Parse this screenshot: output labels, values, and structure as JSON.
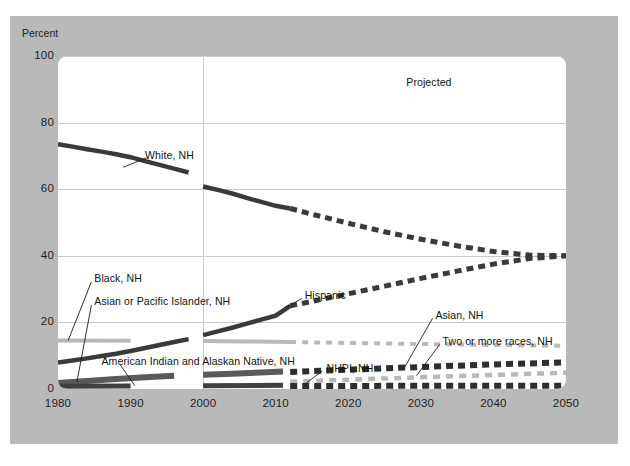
{
  "figure": {
    "percent_axis_title": "Percent",
    "projected_note": "Projected"
  },
  "chart_data": {
    "type": "line",
    "title": "",
    "subtitle": "",
    "xlabel": "",
    "ylabel": "Percent",
    "xlim": [
      1980,
      2050
    ],
    "ylim": [
      0,
      100
    ],
    "grid": true,
    "legend_position": "inline-annotations",
    "xticks": [
      "1980",
      "1990",
      "2000",
      "2010",
      "2020",
      "2030",
      "2040",
      "2050"
    ],
    "yticks": [
      "0",
      "20",
      "40",
      "60",
      "80",
      "100"
    ],
    "annotations": [
      {
        "text": "Projected",
        "x": 2028,
        "y": 92
      },
      {
        "text": "White, NH",
        "x": 1992,
        "y": 70
      },
      {
        "text": "Black, NH",
        "x": 1985,
        "y": 33
      },
      {
        "text": "Asian or Pacific Islander, NH",
        "x": 1985,
        "y": 26
      },
      {
        "text": "American Indian and Alaskan Native, NH",
        "x": 1986,
        "y": 8
      },
      {
        "text": "Hispanic",
        "x": 2014,
        "y": 28
      },
      {
        "text": "Asian, NH",
        "x": 2032,
        "y": 22
      },
      {
        "text": "Two or more races, NH",
        "x": 2033,
        "y": 14
      },
      {
        "text": "NHPI, NH",
        "x": 2017,
        "y": 6
      }
    ],
    "projection_start_year": 2012,
    "vertical_gridline_years": [
      2000
    ],
    "series": [
      {
        "name": "White, NH",
        "style": "solid-then-dashed",
        "color": "#3a3a3a",
        "x": [
          1980,
          1982,
          1984,
          1986,
          1988,
          1990,
          1992,
          1994,
          1996,
          1998,
          2000,
          2002,
          2004,
          2006,
          2008,
          2010,
          2012,
          2015,
          2020,
          2025,
          2030,
          2035,
          2040,
          2045,
          2050
        ],
        "values": [
          73.5,
          72.8,
          72.0,
          71.3,
          70.5,
          69.6,
          68.4,
          67.3,
          66.2,
          65.0,
          60.8,
          59.8,
          58.7,
          57.4,
          56.2,
          55.0,
          54.2,
          52.5,
          49.8,
          47.2,
          45.0,
          43.0,
          41.3,
          40.2,
          40.0
        ]
      },
      {
        "name": "Hispanic",
        "style": "solid-then-dashed",
        "color": "#3a3a3a",
        "x": [
          1980,
          1982,
          1984,
          1986,
          1988,
          1990,
          1992,
          1994,
          1996,
          1998,
          2000,
          2002,
          2004,
          2006,
          2008,
          2010,
          2012,
          2015,
          2020,
          2025,
          2030,
          2035,
          2040,
          2045,
          2050
        ],
        "values": [
          8.0,
          8.6,
          9.2,
          9.9,
          10.6,
          11.4,
          12.3,
          13.2,
          14.1,
          15.0,
          16.2,
          17.3,
          18.4,
          19.6,
          20.8,
          22.0,
          25.0,
          26.3,
          28.6,
          30.9,
          33.2,
          35.4,
          37.5,
          39.2,
          40.0
        ]
      },
      {
        "name": "Black, NH",
        "style": "light-solid-then-dashed",
        "color": "#b8b8b8",
        "x": [
          1980,
          1990,
          2000,
          2005,
          2010,
          2012,
          2020,
          2030,
          2040,
          2050
        ],
        "values": [
          14.6,
          14.5,
          14.4,
          14.3,
          14.2,
          14.1,
          13.8,
          13.5,
          13.2,
          13.0
        ]
      },
      {
        "name": "Asian or Pacific Islander, NH",
        "style": "dark-solid",
        "color": "#5a5a5a",
        "x": [
          1980,
          1984,
          1988,
          1992,
          1996,
          2000,
          2004,
          2008,
          2011
        ],
        "values": [
          1.8,
          2.4,
          3.0,
          3.5,
          4.0,
          4.3,
          4.6,
          5.0,
          5.3
        ]
      },
      {
        "name": "Asian, NH",
        "style": "dashed",
        "color": "#2e2e2e",
        "x": [
          2012,
          2020,
          2030,
          2040,
          2050
        ],
        "values": [
          5.1,
          5.8,
          6.6,
          7.4,
          8.0
        ]
      },
      {
        "name": "Two or more races, NH",
        "style": "light-dashed",
        "color": "#b8b8b8",
        "x": [
          2012,
          2020,
          2030,
          2040,
          2050
        ],
        "values": [
          2.2,
          2.8,
          3.5,
          4.2,
          4.9
        ]
      },
      {
        "name": "American Indian and Alaskan Native, NH",
        "style": "dark-solid-thin",
        "color": "#404040",
        "x": [
          1980,
          1990,
          2000,
          2011
        ],
        "values": [
          0.8,
          0.9,
          1.0,
          1.1
        ]
      },
      {
        "name": "NHPI, NH",
        "style": "dashed-baseline",
        "color": "#2e2e2e",
        "x": [
          2012,
          2020,
          2030,
          2040,
          2050
        ],
        "values": [
          0.9,
          0.9,
          1.0,
          1.0,
          1.0
        ]
      }
    ]
  }
}
